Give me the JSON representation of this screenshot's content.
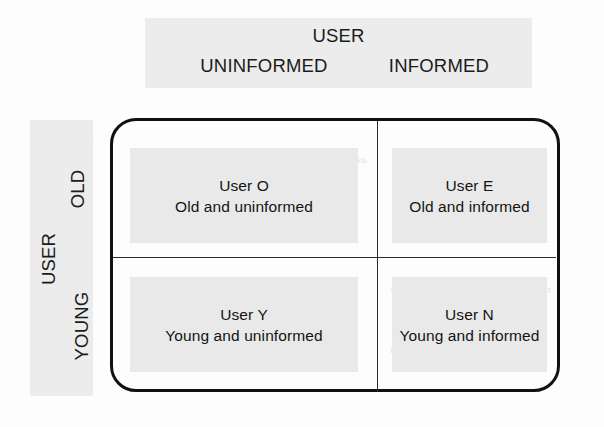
{
  "header": {
    "title": "USER",
    "left_label": "UNINFORMED",
    "right_label": "INFORMED"
  },
  "side": {
    "title": "USER",
    "top_label": "OLD",
    "bottom_label": "YOUNG"
  },
  "cells": [
    {
      "id": "old-uninformed",
      "name": "User O",
      "description": "Old and uninformed"
    },
    {
      "id": "old-informed",
      "name": "User E",
      "description": "Old and informed"
    },
    {
      "id": "young-uninformed",
      "name": "User Y",
      "description": "Young and uninformed"
    },
    {
      "id": "young-informed",
      "name": "User N",
      "description": "Young and informed"
    }
  ],
  "colors": {
    "band_background": "#ececec",
    "cell_background": "#e9e9e9",
    "border": "#111111",
    "text": "#141414"
  },
  "bleed_text": {
    "top_a": "the specific tasks and process of interaction and the",
    "top_b": "the information they have about the system",
    "top_c": "complete their tasks in the environment",
    "left_a": "representing",
    "left_b": "the details",
    "left_c": "of a user",
    "mid_a": "as defined by the user needs, expectations and",
    "mid_b": "gathering from the interface design of the",
    "mid_c": "evaluation to ensure a better match",
    "low_a": "further work on creating a new research",
    "low_b": "to describe the roles as well as the",
    "low_c": "the usability of the system"
  }
}
